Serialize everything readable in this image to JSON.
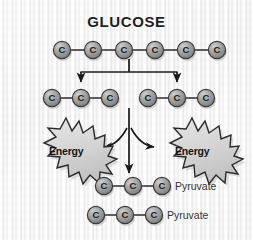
{
  "figure": {
    "title": "GLUCOSE",
    "background_color": "#ededed",
    "atom_fill": "#9a9a9a",
    "atom_stroke": "#3a3a3a",
    "atom_label": "C",
    "bond_color": "#2b2b2b",
    "arrow_color": "#1a1a1a",
    "burst_fill": "#d8d8d8",
    "burst_stroke": "#2b2b2b",
    "text_color": "#333333"
  },
  "glucose_chain": {
    "name": "glucose",
    "carbon_count": 6,
    "atoms": [
      {
        "label": "C"
      },
      {
        "label": "C"
      },
      {
        "label": "C"
      },
      {
        "label": "C"
      },
      {
        "label": "C"
      },
      {
        "label": "C"
      }
    ]
  },
  "intermediate_chains": [
    {
      "name": "left-three-carbon",
      "carbon_count": 3,
      "atoms": [
        {
          "label": "C"
        },
        {
          "label": "C"
        },
        {
          "label": "C"
        }
      ]
    },
    {
      "name": "right-three-carbon",
      "carbon_count": 3,
      "atoms": [
        {
          "label": "C"
        },
        {
          "label": "C"
        },
        {
          "label": "C"
        }
      ]
    }
  ],
  "energy_bursts": [
    {
      "label": "Energy",
      "side": "left"
    },
    {
      "label": "Energy",
      "side": "right"
    }
  ],
  "products": [
    {
      "name": "pyruvate-upper",
      "label": "Pyruvate",
      "carbon_count": 3,
      "atoms": [
        {
          "label": "C"
        },
        {
          "label": "C"
        },
        {
          "label": "C"
        }
      ]
    },
    {
      "name": "pyruvate-lower",
      "label": "Pyruvate",
      "carbon_count": 3,
      "atoms": [
        {
          "label": "C"
        },
        {
          "label": "C"
        },
        {
          "label": "C"
        }
      ]
    }
  ],
  "arrows": [
    {
      "name": "split-bracket-arrow",
      "from": "glucose",
      "to": "three-carbon-chains"
    },
    {
      "name": "center-down-arrow",
      "from": "three-carbon-chains",
      "to": "pyruvate"
    },
    {
      "name": "energy-arrow-left",
      "to": "energy-left"
    },
    {
      "name": "energy-arrow-right",
      "to": "energy-right"
    }
  ]
}
